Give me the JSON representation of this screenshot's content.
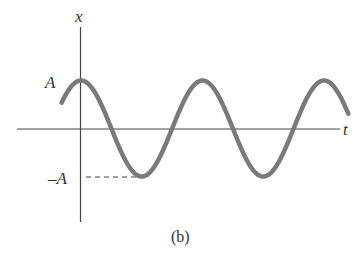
{
  "figure": {
    "caption": "(b)",
    "x_axis_label": "t",
    "y_axis_label": "x",
    "amplitude_label": "A",
    "neg_amplitude_label": "–A"
  },
  "chart_data": {
    "type": "line",
    "title": "",
    "xlabel": "t",
    "ylabel": "x",
    "y_ticks": [
      "A",
      "-A"
    ],
    "series": [
      {
        "name": "x(t)",
        "function": "A*cos(2*pi*t/T)",
        "t_start_periods": -0.16,
        "t_end_periods": 2.2
      }
    ],
    "annotations": [
      "dashed line from x-axis at -A to first trough"
    ],
    "colors": {
      "curve": "#7a7a7a",
      "axes": "#444444"
    }
  }
}
